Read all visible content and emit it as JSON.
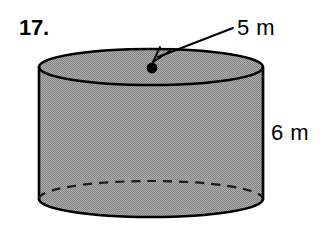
{
  "figure": {
    "problem_number": "17.",
    "shape_name": "cylinder",
    "radius_label": "5 m",
    "height_label": "6 m",
    "radius_value": 5,
    "height_value": 6,
    "units": "m",
    "colors": {
      "background": "#ffffff",
      "body_fill": "#9a9a9a",
      "outline": "#000000",
      "text": "#000000",
      "dot": "#000000"
    },
    "geometry": {
      "center_x": 151,
      "left_x": 39,
      "right_x": 263,
      "radius_x": 112,
      "top_ellipse_cy": 67,
      "bottom_ellipse_cy": 199,
      "ellipse_ry": 18,
      "dot_x": 152,
      "dot_y": 68,
      "dot_r": 5,
      "leader_start_x": 233,
      "leader_start_y": 28,
      "leader_end_x": 157,
      "leader_end_y": 57
    }
  }
}
